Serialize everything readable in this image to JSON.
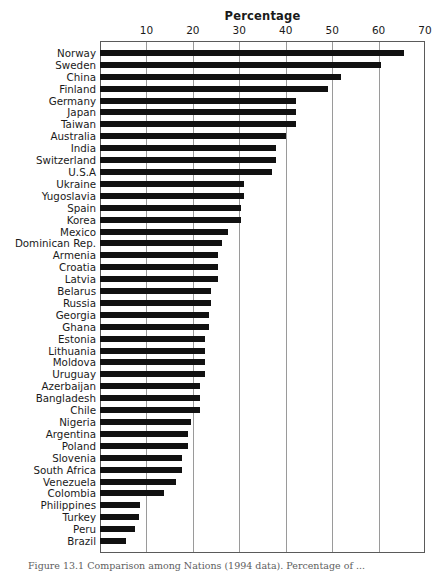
{
  "chart_data": {
    "type": "bar",
    "orientation": "horizontal",
    "title": "Percentage",
    "xlabel": "",
    "ylabel": "",
    "xlim": [
      0,
      70
    ],
    "xticks": [
      0,
      10,
      20,
      30,
      40,
      50,
      60,
      70
    ],
    "xtick_labels": [
      "",
      "10",
      "20",
      "30",
      "40",
      "50",
      "60",
      "70"
    ],
    "grid": true,
    "grid_axis": "x",
    "legend": false,
    "bar_color": "#111111",
    "categories": [
      "Norway",
      "Sweden",
      "China",
      "Finland",
      "Germany",
      "Japan",
      "Taiwan",
      "Australia",
      "India",
      "Switzerland",
      "U.S.A",
      "Ukraine",
      "Yugoslavia",
      "Spain",
      "Korea",
      "Mexico",
      "Dominican Rep.",
      "Armenia",
      "Croatia",
      "Latvia",
      "Belarus",
      "Russia",
      "Georgia",
      "Ghana",
      "Estonia",
      "Lithuania",
      "Moldova",
      "Uruguay",
      "Azerbaijan",
      "Bangladesh",
      "Chile",
      "Nigeria",
      "Argentina",
      "Poland",
      "Slovenia",
      "South Africa",
      "Venezuela",
      "Colombia",
      "Philippines",
      "Turkey",
      "Peru",
      "Brazil"
    ],
    "values": [
      65.5,
      60.5,
      52.0,
      49.0,
      42.2,
      42.2,
      42.2,
      40.0,
      38.0,
      38.0,
      37.0,
      31.0,
      31.0,
      30.4,
      30.4,
      27.6,
      26.3,
      25.4,
      25.4,
      25.4,
      24.0,
      24.0,
      23.5,
      23.5,
      22.6,
      22.6,
      22.6,
      22.6,
      21.5,
      21.5,
      21.5,
      19.7,
      19.0,
      19.0,
      17.7,
      17.7,
      16.4,
      13.7,
      8.7,
      8.5,
      7.5,
      5.5
    ]
  },
  "caption": {
    "text": "Figure 13.1  Comparison among Nations (1994 data). Percentage of ..."
  }
}
